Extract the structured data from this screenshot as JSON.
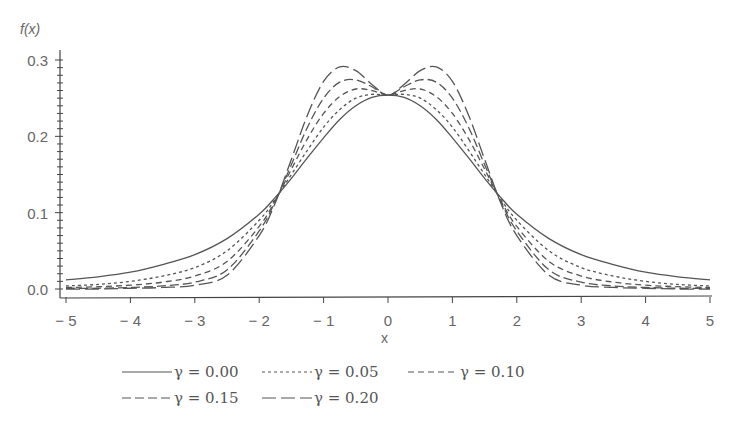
{
  "chart_data": {
    "type": "line",
    "title": "",
    "xlabel": "x",
    "ylabel": "f(x)",
    "xlim": [
      -5,
      5
    ],
    "ylim": [
      0,
      0.3
    ],
    "grid": false,
    "legend_position": "bottom",
    "x_ticks": [
      "-5",
      "-4",
      "-3",
      "-2",
      "-1",
      "0",
      "1",
      "2",
      "3",
      "4",
      "5"
    ],
    "y_ticks": [
      "0.0",
      "0.1",
      "0.2",
      "0.3"
    ],
    "x": [
      -5,
      -4.5,
      -4,
      -3.5,
      -3,
      -2.5,
      -2,
      -1.75,
      -1.5,
      -1.25,
      -1,
      -0.75,
      -0.5,
      -0.25,
      0,
      0.25,
      0.5,
      0.75,
      1,
      1.25,
      1.5,
      1.75,
      2,
      2.5,
      3,
      3.5,
      4,
      4.5,
      5
    ],
    "series": [
      {
        "name": "γ = 0.00",
        "style": "solid",
        "values": [
          0.012,
          0.016,
          0.022,
          0.032,
          0.045,
          0.066,
          0.098,
          0.12,
          0.145,
          0.172,
          0.198,
          0.222,
          0.24,
          0.251,
          0.254,
          0.251,
          0.24,
          0.222,
          0.198,
          0.172,
          0.145,
          0.12,
          0.098,
          0.066,
          0.045,
          0.032,
          0.022,
          0.016,
          0.012
        ]
      },
      {
        "name": "γ = 0.05",
        "style": "dotted",
        "values": [
          0.004,
          0.006,
          0.01,
          0.017,
          0.028,
          0.05,
          0.09,
          0.118,
          0.15,
          0.182,
          0.212,
          0.235,
          0.25,
          0.255,
          0.254,
          0.255,
          0.25,
          0.235,
          0.212,
          0.182,
          0.15,
          0.118,
          0.09,
          0.05,
          0.028,
          0.017,
          0.01,
          0.006,
          0.004
        ]
      },
      {
        "name": "γ = 0.10",
        "style": "short-dash",
        "values": [
          0.002,
          0.003,
          0.005,
          0.009,
          0.017,
          0.036,
          0.082,
          0.116,
          0.157,
          0.197,
          0.23,
          0.252,
          0.262,
          0.26,
          0.254,
          0.26,
          0.262,
          0.252,
          0.23,
          0.197,
          0.157,
          0.116,
          0.082,
          0.036,
          0.017,
          0.009,
          0.005,
          0.003,
          0.002
        ]
      },
      {
        "name": "γ = 0.15",
        "style": "dash",
        "values": [
          0.001,
          0.001,
          0.002,
          0.004,
          0.009,
          0.025,
          0.076,
          0.115,
          0.163,
          0.212,
          0.25,
          0.271,
          0.274,
          0.265,
          0.254,
          0.265,
          0.274,
          0.271,
          0.25,
          0.212,
          0.163,
          0.115,
          0.076,
          0.025,
          0.009,
          0.004,
          0.002,
          0.001,
          0.001
        ]
      },
      {
        "name": "γ = 0.20",
        "style": "long-dash",
        "values": [
          0.0,
          0.0,
          0.001,
          0.002,
          0.005,
          0.018,
          0.07,
          0.113,
          0.17,
          0.228,
          0.272,
          0.291,
          0.286,
          0.268,
          0.254,
          0.268,
          0.286,
          0.291,
          0.272,
          0.228,
          0.17,
          0.113,
          0.07,
          0.018,
          0.005,
          0.002,
          0.001,
          0.0,
          0.0
        ]
      }
    ]
  },
  "labels": {
    "ylabel": "f(x)",
    "xlabel": "x"
  },
  "legend": [
    {
      "label": "γ = 0.00",
      "style": "solid"
    },
    {
      "label": "γ = 0.05",
      "style": "dotted"
    },
    {
      "label": "γ = 0.10",
      "style": "short-dash"
    },
    {
      "label": "γ = 0.15",
      "style": "dash"
    },
    {
      "label": "γ = 0.20",
      "style": "long-dash"
    }
  ],
  "colors": {
    "line": "#555555",
    "axis": "#444444",
    "text": "#666666"
  }
}
